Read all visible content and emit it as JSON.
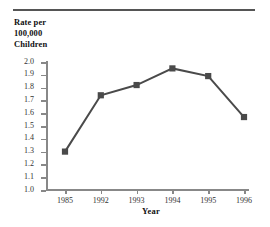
{
  "chart_data": {
    "type": "line",
    "title": "",
    "ylabel": "Rate per 100,000 Children",
    "ylabel_lines": [
      "Rate per",
      "100,000",
      "Children"
    ],
    "xlabel": "Year",
    "categories": [
      "1985",
      "1992",
      "1993",
      "1994",
      "1995",
      "1996"
    ],
    "values": [
      1.3,
      1.74,
      1.82,
      1.95,
      1.89,
      1.57
    ],
    "series": [
      {
        "name": "Rate per 100,000 Children",
        "values": [
          1.3,
          1.74,
          1.82,
          1.95,
          1.89,
          1.57
        ]
      }
    ],
    "ylim": [
      1.0,
      2.0
    ],
    "ytick_step": 0.1,
    "ytick_labels": [
      "2.0",
      "1.9",
      "1.8",
      "1.7",
      "1.6",
      "1.5",
      "1.4",
      "1.3",
      "1.2",
      "1.1",
      "1.0"
    ],
    "ytick_values": [
      2.0,
      1.9,
      1.8,
      1.7,
      1.6,
      1.5,
      1.4,
      1.3,
      1.2,
      1.1,
      1.0
    ],
    "xtick_labels": [
      "1985",
      "1992",
      "1993",
      "1994",
      "1995",
      "1996"
    ],
    "grid": false,
    "legend": false,
    "legend_position": "none",
    "marker": "square",
    "line_color": "#4a4a4a",
    "marker_color": "#4a4a4a",
    "axis_color": "#888888",
    "rule_color": "#555555"
  }
}
